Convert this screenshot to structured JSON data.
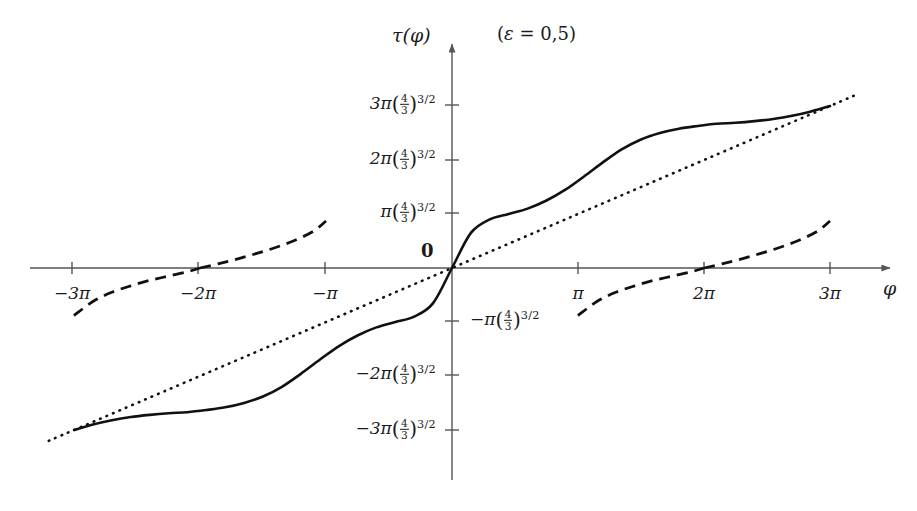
{
  "figure": {
    "background_color": "#ffffff",
    "ink_color": "#1a1a1a",
    "axis_color": "#555555",
    "width": 917,
    "height": 511
  },
  "axes": {
    "y_axis_title": "τ(φ)",
    "x_axis_title": "φ",
    "origin_label": "0",
    "annotation": "(ε = 0,5)",
    "annotation_epsilon": "ε",
    "annotation_value": "0,5"
  },
  "x_ticks": [
    {
      "label": "−3π",
      "value": -3,
      "px": 72
    },
    {
      "label": "−2π",
      "value": -2,
      "px": 198
    },
    {
      "label": "−π",
      "value": -1,
      "px": 325
    },
    {
      "label": "π",
      "value": 1,
      "px": 578
    },
    {
      "label": "2π",
      "value": 2,
      "px": 704
    },
    {
      "label": "3π",
      "value": 3,
      "px": 830
    }
  ],
  "y_ticks": [
    {
      "mantissa": "3π",
      "num": "4",
      "den": "3",
      "exp": "3/2",
      "value": 3,
      "px": 105,
      "side": "left"
    },
    {
      "mantissa": "2π",
      "num": "4",
      "den": "3",
      "exp": "3/2",
      "value": 2,
      "px": 160,
      "side": "left"
    },
    {
      "mantissa": "π",
      "num": "4",
      "den": "3",
      "exp": "3/2",
      "value": 1,
      "px": 213,
      "side": "left"
    },
    {
      "mantissa": "−π",
      "num": "4",
      "den": "3",
      "exp": "3/2",
      "value": -1,
      "px": 321,
      "side": "right"
    },
    {
      "mantissa": "−2π",
      "num": "4",
      "den": "3",
      "exp": "3/2",
      "value": -2,
      "px": 375,
      "side": "left"
    },
    {
      "mantissa": "−3π",
      "num": "4",
      "den": "3",
      "exp": "3/2",
      "value": -3,
      "px": 430,
      "side": "left"
    }
  ],
  "chart_data": {
    "type": "line",
    "title": "",
    "subtitle": "(ε = 0,5)",
    "xlabel": "φ",
    "ylabel": "τ(φ)",
    "grid": false,
    "legend": "none",
    "xlim": [
      -3.35,
      3.35
    ],
    "ylim": [
      -3.5,
      3.5
    ],
    "x_unit": "π",
    "y_unit": "π(4/3)^{3/2}",
    "parameters": {
      "epsilon": 0.5
    },
    "series": [
      {
        "name": "tau(phi) staircase (solid)",
        "style": "solid",
        "color": "#111111",
        "width": 2.6,
        "x": [
          -3.0,
          -2.85,
          -2.7,
          -2.55,
          -2.4,
          -2.25,
          -2.1,
          -1.95,
          -1.8,
          -1.65,
          -1.5,
          -1.35,
          -1.2,
          -1.05,
          -0.9,
          -0.75,
          -0.6,
          -0.45,
          -0.3,
          -0.15,
          0.0,
          0.15,
          0.3,
          0.45,
          0.6,
          0.75,
          0.9,
          1.05,
          1.2,
          1.35,
          1.5,
          1.65,
          1.8,
          1.95,
          2.1,
          2.25,
          2.4,
          2.55,
          2.7,
          2.85,
          3.0
        ],
        "y": [
          -3.0,
          -2.9,
          -2.82,
          -2.76,
          -2.72,
          -2.69,
          -2.67,
          -2.63,
          -2.58,
          -2.5,
          -2.38,
          -2.2,
          -1.96,
          -1.7,
          -1.45,
          -1.25,
          -1.1,
          -1.0,
          -0.9,
          -0.65,
          0.0,
          0.65,
          0.9,
          1.0,
          1.1,
          1.25,
          1.45,
          1.7,
          1.96,
          2.2,
          2.38,
          2.5,
          2.58,
          2.63,
          2.67,
          2.69,
          2.72,
          2.76,
          2.82,
          2.9,
          3.0
        ]
      },
      {
        "name": "mean-motion reference line (dotted)",
        "style": "dotted",
        "color": "#111111",
        "width": 2.6,
        "x": [
          -3.2,
          3.2
        ],
        "y": [
          -3.2,
          3.2
        ]
      },
      {
        "name": "periodic deviation (dashed)",
        "style": "dashed",
        "color": "#111111",
        "width": 2.8,
        "period": 2,
        "branches": [
          {
            "x": [
              -3.0,
              -2.85,
              -2.7,
              -2.55,
              -2.4,
              -2.25,
              -2.1,
              -2.0
            ],
            "y": [
              -0.88,
              -0.62,
              -0.45,
              -0.33,
              -0.23,
              -0.15,
              -0.07,
              0.0
            ]
          },
          {
            "x": [
              -2.0,
              -1.85,
              -1.7,
              -1.55,
              -1.4,
              -1.25,
              -1.1,
              -1.0
            ],
            "y": [
              0.0,
              0.08,
              0.17,
              0.27,
              0.38,
              0.51,
              0.68,
              0.87
            ]
          },
          {
            "x": [
              1.0,
              1.15,
              1.3,
              1.45,
              1.6,
              1.75,
              1.9,
              2.0
            ],
            "y": [
              -0.88,
              -0.62,
              -0.45,
              -0.33,
              -0.23,
              -0.15,
              -0.07,
              0.0
            ]
          },
          {
            "x": [
              2.0,
              2.15,
              2.3,
              2.45,
              2.6,
              2.75,
              2.9,
              3.0
            ],
            "y": [
              0.0,
              0.08,
              0.17,
              0.27,
              0.38,
              0.51,
              0.68,
              0.87
            ]
          }
        ]
      }
    ]
  }
}
